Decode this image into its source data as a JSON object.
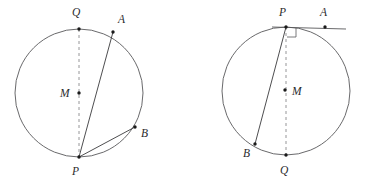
{
  "figure": {
    "background_color": "#ffffff",
    "stroke_color": "#58585a",
    "dash_color": "#8a8a8c",
    "label_color": "#2a2a2c",
    "panels": [
      {
        "id": "left-panel",
        "name": "left-circle-diagram",
        "circle": {
          "cx": 79,
          "cy": 93,
          "r": 64
        },
        "points": [
          {
            "key": "Q",
            "label": "Q",
            "x": 79,
            "y": 29,
            "label_x": 72,
            "label_y": 16,
            "has_dot": true
          },
          {
            "key": "A",
            "label": "A",
            "x": 113,
            "y": 32,
            "label_x": 118,
            "label_y": 23,
            "has_dot": true
          },
          {
            "key": "M",
            "label": "M",
            "x": 79,
            "y": 93,
            "label_x": 60,
            "label_y": 97,
            "has_dot": true
          },
          {
            "key": "B",
            "label": "B",
            "x": 135,
            "y": 127,
            "label_x": 141,
            "label_y": 137,
            "has_dot": true
          },
          {
            "key": "P",
            "label": "P",
            "x": 79,
            "y": 157,
            "label_x": 72,
            "label_y": 175,
            "has_dot": true
          }
        ],
        "segments": [
          {
            "name": "chord-PA",
            "from": "P",
            "to": "A"
          },
          {
            "name": "chord-PB",
            "from": "P",
            "to": "B"
          }
        ],
        "dashed_segments": [
          {
            "name": "diameter-QP",
            "from": "Q",
            "to": "P"
          }
        ],
        "right_angle": null
      },
      {
        "id": "right-panel",
        "name": "right-circle-diagram",
        "circle": {
          "cx": 286,
          "cy": 91,
          "r": 64
        },
        "points": [
          {
            "key": "P",
            "label": "P",
            "x": 286,
            "y": 27,
            "label_x": 279,
            "label_y": 16,
            "has_dot": true
          },
          {
            "key": "A",
            "label": "A",
            "x": 325,
            "y": 27,
            "label_x": 320,
            "label_y": 16,
            "has_dot": true
          },
          {
            "key": "M",
            "label": "M",
            "x": 285,
            "y": 90,
            "label_x": 292,
            "label_y": 95,
            "has_dot": true
          },
          {
            "key": "B",
            "label": "B",
            "x": 255,
            "y": 144,
            "label_x": 243,
            "label_y": 157,
            "has_dot": true
          },
          {
            "key": "Q",
            "label": "Q",
            "x": 286,
            "y": 155,
            "label_x": 280,
            "label_y": 174,
            "has_dot": true
          }
        ],
        "segments": [
          {
            "name": "chord-PB",
            "from": "P",
            "to": "B"
          }
        ],
        "dashed_segments": [
          {
            "name": "diameter-PQ",
            "from": "P",
            "to": "Q"
          }
        ],
        "tangent": {
          "name": "tangent-PA",
          "x1": 272,
          "y1": 27,
          "x2": 346,
          "y2": 29
        },
        "right_angle": {
          "name": "right-angle-at-P",
          "x": 287,
          "y": 28,
          "size": 9
        }
      }
    ]
  }
}
